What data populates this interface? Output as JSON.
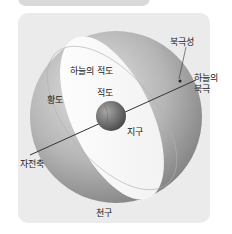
{
  "header": {
    "title": ""
  },
  "diagram": {
    "labels": {
      "polaris": "북극성",
      "north_celestial_pole_line1": "하늘의",
      "north_celestial_pole_line2": "북극",
      "celestial_equator": "하늘의 적도",
      "equator": "적도",
      "ecliptic": "황도",
      "earth": "지구",
      "rotation_axis": "자전축",
      "celestial_sphere": "천구"
    },
    "colors": {
      "panel": "#ebebeb",
      "sphere_light": "#d8d8d8",
      "sphere_dark": "#8a8a8a",
      "equator_plane": "#ffffff",
      "earth": "#6e6e6e",
      "axis": "#333333"
    }
  }
}
